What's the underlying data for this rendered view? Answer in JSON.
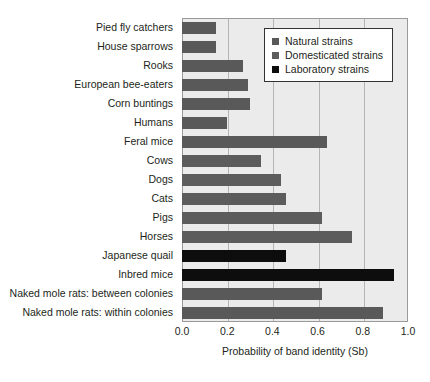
{
  "chart_data": {
    "type": "bar",
    "orientation": "horizontal",
    "title": "",
    "xlabel": "Probability of band identity (Sb)",
    "ylabel": "",
    "xlim": [
      0.0,
      1.0
    ],
    "xticks": [
      "0.0",
      "0.2",
      "0.4",
      "0.6",
      "0.8",
      "1.0"
    ],
    "xtick_values": [
      0.0,
      0.2,
      0.4,
      0.6,
      0.8,
      1.0
    ],
    "grid": "vertical",
    "legend_position": "top-right",
    "categories": [
      "Pied fly catchers",
      "House sparrows",
      "Rooks",
      "European bee-eaters",
      "Corn buntings",
      "Humans",
      "Feral mice",
      "Cows",
      "Dogs",
      "Cats",
      "Pigs",
      "Horses",
      "Japanese quail",
      "Inbred mice",
      "Naked mole rats: between colonies",
      "Naked mole rats: within colonies"
    ],
    "values": [
      0.15,
      0.15,
      0.27,
      0.29,
      0.3,
      0.2,
      0.64,
      0.35,
      0.44,
      0.46,
      0.62,
      0.75,
      0.46,
      0.94,
      0.62,
      0.89
    ],
    "groups": [
      "Natural strains",
      "Natural strains",
      "Natural strains",
      "Natural strains",
      "Natural strains",
      "Natural strains",
      "Natural strains",
      "Domesticated strains",
      "Domesticated strains",
      "Domesticated strains",
      "Domesticated strains",
      "Domesticated strains",
      "Laboratory strains",
      "Laboratory strains",
      "Natural strains",
      "Natural strains"
    ],
    "series": [
      {
        "name": "Natural strains",
        "color": "#595959",
        "points": [
          {
            "category": "Pied fly catchers",
            "value": 0.15
          },
          {
            "category": "House sparrows",
            "value": 0.15
          },
          {
            "category": "Rooks",
            "value": 0.27
          },
          {
            "category": "European bee-eaters",
            "value": 0.29
          },
          {
            "category": "Corn buntings",
            "value": 0.3
          },
          {
            "category": "Humans",
            "value": 0.2
          },
          {
            "category": "Feral mice",
            "value": 0.64
          },
          {
            "category": "Naked mole rats: between colonies",
            "value": 0.62
          },
          {
            "category": "Naked mole rats: within colonies",
            "value": 0.89
          }
        ]
      },
      {
        "name": "Domesticated strains",
        "color": "#5c5c5c",
        "points": [
          {
            "category": "Cows",
            "value": 0.35
          },
          {
            "category": "Dogs",
            "value": 0.44
          },
          {
            "category": "Cats",
            "value": 0.46
          },
          {
            "category": "Pigs",
            "value": 0.62
          },
          {
            "category": "Horses",
            "value": 0.75
          }
        ]
      },
      {
        "name": "Laboratory strains",
        "color": "#0d0d0d",
        "points": [
          {
            "category": "Japanese quail",
            "value": 0.46
          },
          {
            "category": "Inbred mice",
            "value": 0.94
          }
        ]
      }
    ]
  },
  "legend": {
    "items": [
      {
        "label": "Natural strains",
        "color": "#595959"
      },
      {
        "label": "Domesticated strains",
        "color": "#5c5c5c"
      },
      {
        "label": "Laboratory strains",
        "color": "#0d0d0d"
      }
    ]
  },
  "colors": {
    "plot_background": "#ebebeb",
    "gridline": "#b5b5b5",
    "frame": "#9a9a9a",
    "text": "#231f20",
    "natural": "#595959",
    "domesticated": "#5c5c5c",
    "laboratory": "#0d0d0d"
  }
}
